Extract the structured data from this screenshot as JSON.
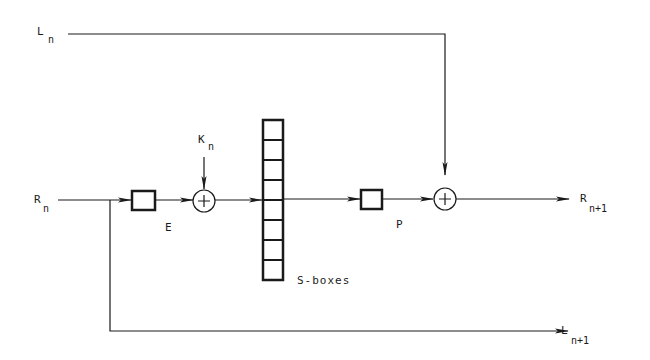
{
  "diagram": {
    "type": "feistel-round",
    "colors": {
      "ink": "#1a1a1a",
      "background": "#ffffff"
    },
    "labels": {
      "L_in": {
        "base": "L",
        "sub": "n"
      },
      "R_in": {
        "base": "R",
        "sub": "n"
      },
      "K": {
        "base": "K",
        "sub": "n"
      },
      "E": "E",
      "sboxes": "S-boxes",
      "P": "P",
      "R_out": {
        "base": "R",
        "sub": "n+1"
      },
      "L_out": {
        "base": "L",
        "sub": "n+1"
      }
    },
    "sbox_count": 8,
    "nodes": [
      "E box",
      "XOR with K_n",
      "S-boxes",
      "P box",
      "XOR with L_n"
    ]
  }
}
